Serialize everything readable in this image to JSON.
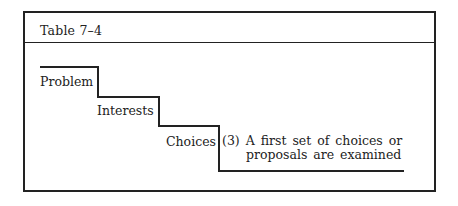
{
  "table": {
    "title": "Table 7–4"
  },
  "staircase": {
    "steps": [
      {
        "label": "Problem"
      },
      {
        "label": "Interests"
      },
      {
        "label": "Choices"
      }
    ],
    "description": {
      "number": "(3)",
      "line1": "A first set of choices or",
      "line2": "proposals are examined"
    }
  }
}
